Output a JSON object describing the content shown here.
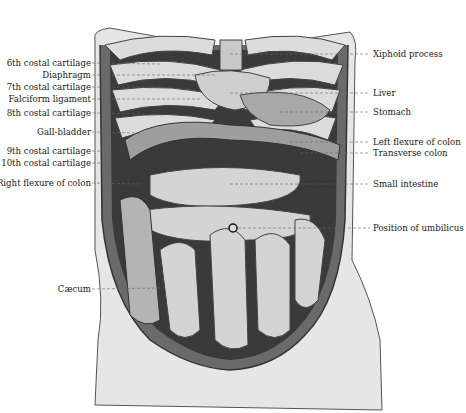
{
  "figure": {
    "header_fragment": "",
    "colors": {
      "background": "#ffffff",
      "ink": "#1a1a1a",
      "skin": "#e4e4e4",
      "skin_shadow": "#b8b8b8",
      "cavity_dark": "#3a3a3a",
      "organ_light": "#d6d6d6",
      "organ_mid": "#9a9a9a"
    }
  },
  "labels_left": [
    {
      "text": "6th costal cartilage",
      "y": 63
    },
    {
      "text": "Diaphragm",
      "y": 75
    },
    {
      "text": "7th costal cartilage",
      "y": 87
    },
    {
      "text": "Falciform ligament",
      "y": 99
    },
    {
      "text": "8th costal cartilage",
      "y": 113
    },
    {
      "text": "Gall-bladder",
      "y": 132
    },
    {
      "text": "9th costal cartilage",
      "y": 151
    },
    {
      "text": "10th costal cartilage",
      "y": 163
    },
    {
      "text": "Right flexure of colon",
      "y": 183
    },
    {
      "text": "Cæcum",
      "y": 289
    }
  ],
  "labels_right": [
    {
      "text": "Xiphoid process",
      "y": 54
    },
    {
      "text": "Liver",
      "y": 93
    },
    {
      "text": "Stomach",
      "y": 112
    },
    {
      "text": "Left flexure of colon",
      "y": 142
    },
    {
      "text": "Transverse colon",
      "y": 153
    },
    {
      "text": "Small intestine",
      "y": 184
    },
    {
      "text": "Position of umbilicus",
      "y": 228
    }
  ]
}
